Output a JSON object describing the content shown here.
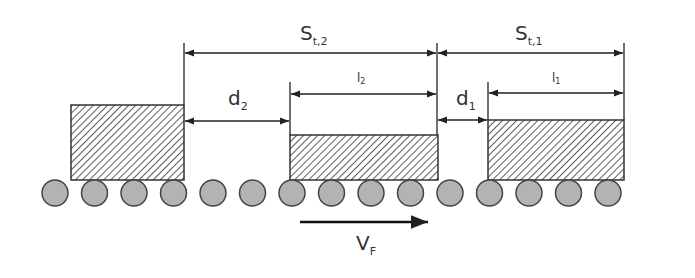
{
  "diagram": {
    "labels": {
      "s12_main": "S",
      "s12_sub": "t,2",
      "s11_main": "S",
      "s11_sub": "t,1",
      "d2_main": "d",
      "d2_sub": "2",
      "d1_main": "d",
      "d1_sub": "1",
      "l2_main": "l",
      "l2_sub": "2",
      "l1_main": "l",
      "l1_sub": "1",
      "vf_main": "V",
      "vf_sub": "F"
    },
    "colors": {
      "line": "#222222",
      "roller_fill": "#b3b3b3",
      "roller_stroke": "#444444",
      "hatch": "#333333"
    },
    "boxes": [
      {
        "name": "load-3",
        "x": 71,
        "y": 105,
        "w": 113,
        "h": 75
      },
      {
        "name": "load-2",
        "x": 290,
        "y": 135,
        "w": 148,
        "h": 45
      },
      {
        "name": "load-1",
        "x": 488,
        "y": 120,
        "w": 136,
        "h": 60
      }
    ],
    "rollers": {
      "count": 15,
      "first_cx": 55,
      "spacing": 39.6,
      "cy": 193,
      "r": 13
    }
  }
}
